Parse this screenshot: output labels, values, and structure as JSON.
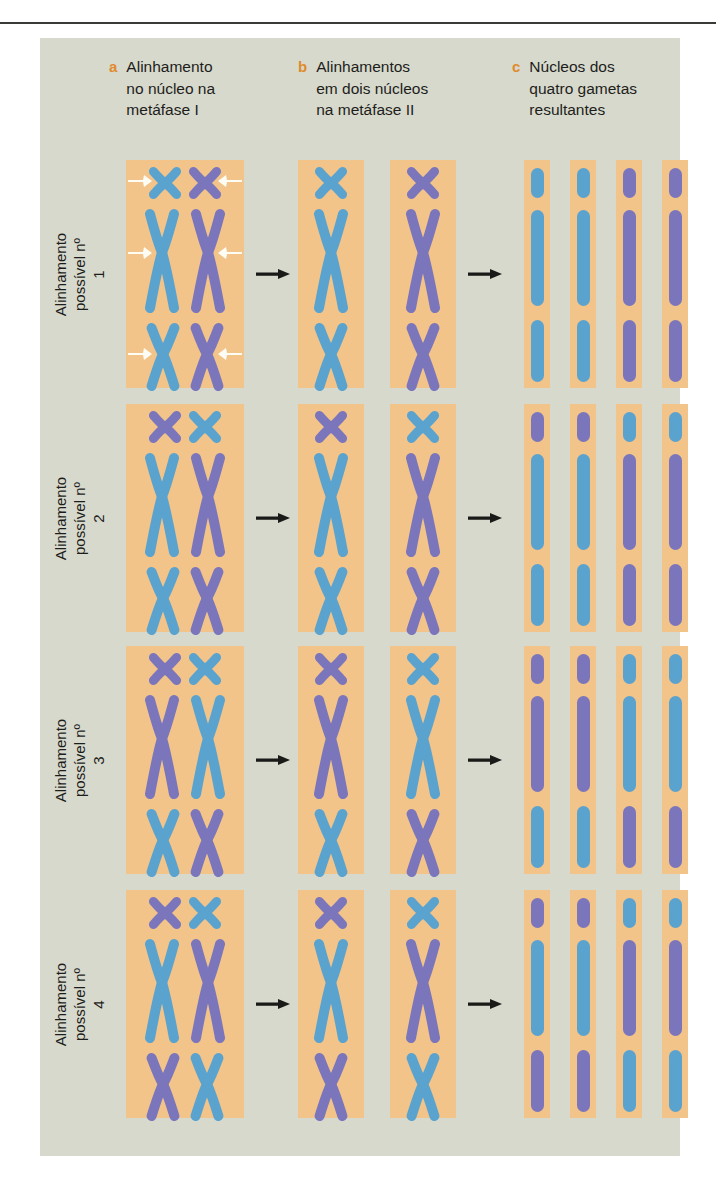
{
  "figure": {
    "background_color": "#d7d9cc",
    "nucleus_color": "#f3c489",
    "label_letter_color": "#e08a2e",
    "chromosome_blue": "#5ba3cf",
    "chromosome_purple": "#7b76bc",
    "spindle_arrow_color": "#fdfdf5",
    "flow_arrow_color": "#1a1a18"
  },
  "headers": [
    {
      "letter": "a",
      "text": "Alinhamento\nno núcleo na\nmetáfase I"
    },
    {
      "letter": "b",
      "text": "Alinhamentos\nem dois núcleos\nna metáfase II"
    },
    {
      "letter": "c",
      "text": "Núcleos dos\nquatro gametas\nresultantes"
    }
  ],
  "rows": [
    {
      "label": "Alinhamento\npossível nº 1",
      "metaphase1": {
        "pairs": [
          {
            "size": "small",
            "left": "blue",
            "right": "purple"
          },
          {
            "size": "large",
            "left": "blue",
            "right": "purple"
          },
          {
            "size": "medium",
            "left": "blue",
            "right": "purple"
          }
        ],
        "spindle_arrows": true
      },
      "metaphase2": [
        {
          "chromosomes": [
            {
              "size": "small",
              "color": "blue"
            },
            {
              "size": "large",
              "color": "blue"
            },
            {
              "size": "medium",
              "color": "blue"
            }
          ]
        },
        {
          "chromosomes": [
            {
              "size": "small",
              "color": "purple"
            },
            {
              "size": "large",
              "color": "purple"
            },
            {
              "size": "medium",
              "color": "purple"
            }
          ]
        }
      ],
      "gametes": [
        {
          "chromosomes": [
            {
              "size": "small",
              "color": "blue"
            },
            {
              "size": "large",
              "color": "blue"
            },
            {
              "size": "medium",
              "color": "blue"
            }
          ]
        },
        {
          "chromosomes": [
            {
              "size": "small",
              "color": "blue"
            },
            {
              "size": "large",
              "color": "blue"
            },
            {
              "size": "medium",
              "color": "blue"
            }
          ]
        },
        {
          "chromosomes": [
            {
              "size": "small",
              "color": "purple"
            },
            {
              "size": "large",
              "color": "purple"
            },
            {
              "size": "medium",
              "color": "purple"
            }
          ]
        },
        {
          "chromosomes": [
            {
              "size": "small",
              "color": "purple"
            },
            {
              "size": "large",
              "color": "purple"
            },
            {
              "size": "medium",
              "color": "purple"
            }
          ]
        }
      ]
    },
    {
      "label": "Alinhamento\npossível nº 2",
      "metaphase1": {
        "pairs": [
          {
            "size": "small",
            "left": "purple",
            "right": "blue"
          },
          {
            "size": "large",
            "left": "blue",
            "right": "purple"
          },
          {
            "size": "medium",
            "left": "blue",
            "right": "purple"
          }
        ],
        "spindle_arrows": false
      },
      "metaphase2": [
        {
          "chromosomes": [
            {
              "size": "small",
              "color": "purple"
            },
            {
              "size": "large",
              "color": "blue"
            },
            {
              "size": "medium",
              "color": "blue"
            }
          ]
        },
        {
          "chromosomes": [
            {
              "size": "small",
              "color": "blue"
            },
            {
              "size": "large",
              "color": "purple"
            },
            {
              "size": "medium",
              "color": "purple"
            }
          ]
        }
      ],
      "gametes": [
        {
          "chromosomes": [
            {
              "size": "small",
              "color": "purple"
            },
            {
              "size": "large",
              "color": "blue"
            },
            {
              "size": "medium",
              "color": "blue"
            }
          ]
        },
        {
          "chromosomes": [
            {
              "size": "small",
              "color": "purple"
            },
            {
              "size": "large",
              "color": "blue"
            },
            {
              "size": "medium",
              "color": "blue"
            }
          ]
        },
        {
          "chromosomes": [
            {
              "size": "small",
              "color": "blue"
            },
            {
              "size": "large",
              "color": "purple"
            },
            {
              "size": "medium",
              "color": "purple"
            }
          ]
        },
        {
          "chromosomes": [
            {
              "size": "small",
              "color": "blue"
            },
            {
              "size": "large",
              "color": "purple"
            },
            {
              "size": "medium",
              "color": "purple"
            }
          ]
        }
      ]
    },
    {
      "label": "Alinhamento\npossível nº 3",
      "metaphase1": {
        "pairs": [
          {
            "size": "small",
            "left": "purple",
            "right": "blue"
          },
          {
            "size": "large",
            "left": "purple",
            "right": "blue"
          },
          {
            "size": "medium",
            "left": "blue",
            "right": "purple"
          }
        ],
        "spindle_arrows": false
      },
      "metaphase2": [
        {
          "chromosomes": [
            {
              "size": "small",
              "color": "purple"
            },
            {
              "size": "large",
              "color": "purple"
            },
            {
              "size": "medium",
              "color": "blue"
            }
          ]
        },
        {
          "chromosomes": [
            {
              "size": "small",
              "color": "blue"
            },
            {
              "size": "large",
              "color": "blue"
            },
            {
              "size": "medium",
              "color": "purple"
            }
          ]
        }
      ],
      "gametes": [
        {
          "chromosomes": [
            {
              "size": "small",
              "color": "purple"
            },
            {
              "size": "large",
              "color": "purple"
            },
            {
              "size": "medium",
              "color": "blue"
            }
          ]
        },
        {
          "chromosomes": [
            {
              "size": "small",
              "color": "purple"
            },
            {
              "size": "large",
              "color": "purple"
            },
            {
              "size": "medium",
              "color": "blue"
            }
          ]
        },
        {
          "chromosomes": [
            {
              "size": "small",
              "color": "blue"
            },
            {
              "size": "large",
              "color": "blue"
            },
            {
              "size": "medium",
              "color": "purple"
            }
          ]
        },
        {
          "chromosomes": [
            {
              "size": "small",
              "color": "blue"
            },
            {
              "size": "large",
              "color": "blue"
            },
            {
              "size": "medium",
              "color": "purple"
            }
          ]
        }
      ]
    },
    {
      "label": "Alinhamento\npossível nº 4",
      "metaphase1": {
        "pairs": [
          {
            "size": "small",
            "left": "purple",
            "right": "blue"
          },
          {
            "size": "large",
            "left": "blue",
            "right": "purple"
          },
          {
            "size": "medium",
            "left": "purple",
            "right": "blue"
          }
        ],
        "spindle_arrows": false
      },
      "metaphase2": [
        {
          "chromosomes": [
            {
              "size": "small",
              "color": "purple"
            },
            {
              "size": "large",
              "color": "blue"
            },
            {
              "size": "medium",
              "color": "purple"
            }
          ]
        },
        {
          "chromosomes": [
            {
              "size": "small",
              "color": "blue"
            },
            {
              "size": "large",
              "color": "purple"
            },
            {
              "size": "medium",
              "color": "blue"
            }
          ]
        }
      ],
      "gametes": [
        {
          "chromosomes": [
            {
              "size": "small",
              "color": "purple"
            },
            {
              "size": "large",
              "color": "blue"
            },
            {
              "size": "medium",
              "color": "purple"
            }
          ]
        },
        {
          "chromosomes": [
            {
              "size": "small",
              "color": "purple"
            },
            {
              "size": "large",
              "color": "blue"
            },
            {
              "size": "medium",
              "color": "purple"
            }
          ]
        },
        {
          "chromosomes": [
            {
              "size": "small",
              "color": "blue"
            },
            {
              "size": "large",
              "color": "purple"
            },
            {
              "size": "medium",
              "color": "blue"
            }
          ]
        },
        {
          "chromosomes": [
            {
              "size": "small",
              "color": "blue"
            },
            {
              "size": "large",
              "color": "purple"
            },
            {
              "size": "medium",
              "color": "blue"
            }
          ]
        }
      ]
    }
  ]
}
